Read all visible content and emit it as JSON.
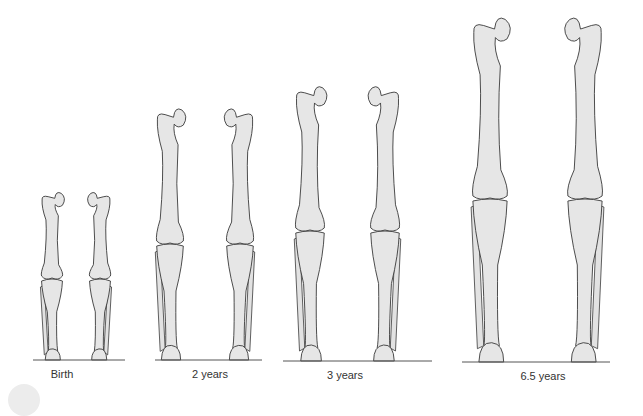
{
  "figure": {
    "groups": [
      {
        "label": "Birth",
        "label_x": 62,
        "baseline_y": 360,
        "line": [
          33,
          125
        ],
        "left_x": 52,
        "right_x": 100,
        "head_top": 195,
        "knee_y": 278,
        "width": 22
      },
      {
        "label": "2 years",
        "label_x": 210,
        "baseline_y": 360,
        "line": [
          155,
          262
        ],
        "left_x": 170,
        "right_x": 240,
        "head_top": 112,
        "knee_y": 243,
        "width": 28
      },
      {
        "label": "3 years",
        "label_x": 345,
        "baseline_y": 361,
        "line": [
          283,
          432
        ],
        "left_x": 310,
        "right_x": 385,
        "head_top": 90,
        "knee_y": 230,
        "width": 30
      },
      {
        "label": "6.5 years",
        "label_x": 543,
        "baseline_y": 362,
        "line": [
          462,
          610
        ],
        "left_x": 490,
        "right_x": 585,
        "head_top": 22,
        "knee_y": 198,
        "width": 36
      }
    ]
  },
  "colors": {
    "bone_fill": "#e6e6e6",
    "outline": "#3a3a3a",
    "text": "#333333"
  }
}
